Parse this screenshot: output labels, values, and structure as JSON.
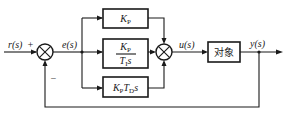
{
  "diagram": {
    "type": "block-diagram",
    "signals": {
      "input": "r(s)",
      "error": "e(s)",
      "control": "u(s)",
      "output": "y(s)"
    },
    "summing_junction_1": {
      "plus_sign": "+",
      "minus_sign": "−"
    },
    "blocks": {
      "proportional": {
        "main": "K",
        "sub": "P"
      },
      "integral": {
        "num_main": "K",
        "num_sub": "P",
        "den_main": "T",
        "den_sub": "I",
        "den_s": "s"
      },
      "derivative": {
        "k_main": "K",
        "k_sub": "P",
        "t_main": "T",
        "t_sub": "D",
        "s": "s"
      },
      "plant": {
        "label": "对象"
      }
    }
  }
}
